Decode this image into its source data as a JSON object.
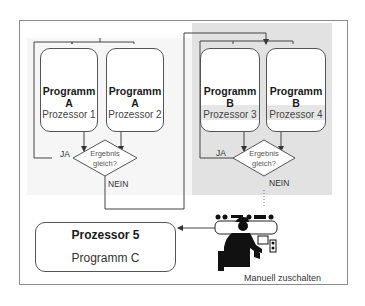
{
  "diagram": {
    "left_group": {
      "boxes": [
        {
          "program": "Programm A",
          "processor": "Prozessor 1"
        },
        {
          "program": "Programm A",
          "processor": "Prozessor 2"
        }
      ],
      "decision": {
        "line1": "Ergebnis",
        "line2": "gleich?"
      },
      "yes_label": "JA",
      "no_label": "NEIN"
    },
    "right_group": {
      "boxes": [
        {
          "program": "Programm B",
          "processor": "Prozessor 3"
        },
        {
          "program": "Programm B",
          "processor": "Prozessor 4"
        }
      ],
      "decision": {
        "line1": "Ergebnis",
        "line2": "gleich?"
      },
      "yes_label": "JA",
      "no_label": "NEIN"
    },
    "fallback": {
      "title": "Prozessor 5",
      "program": "Programm C"
    },
    "operator": {
      "icon": "operator-at-console-icon",
      "caption": "Manuell zuschalten"
    },
    "colors": {
      "frame": "#8c8c8c",
      "line": "#444444",
      "right_panel_bg": "#e2e2e2",
      "left_panel_bg": "#f6f6f6"
    }
  }
}
